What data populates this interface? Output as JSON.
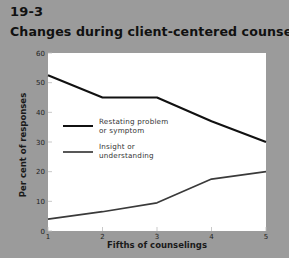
{
  "figure": {
    "number": "19-3",
    "title": "Changes during client-centered counseling"
  },
  "colors": {
    "page_background": "#9b9b9b",
    "plot_background": "#ffffff",
    "restating_line": "#111111",
    "insight_line": "#3a3a3a"
  },
  "chart_data": {
    "type": "line",
    "title": "Changes during client-centered counseling",
    "xlabel": "Fifths of counselings",
    "ylabel": "Per cent of responses",
    "x": [
      1,
      2,
      3,
      4,
      5
    ],
    "xticks": [
      "1",
      "2",
      "3",
      "4",
      "5"
    ],
    "yticks": [
      "0",
      "10",
      "20",
      "30",
      "40",
      "50",
      "60"
    ],
    "ylim": [
      0,
      60
    ],
    "xlim": [
      1,
      5
    ],
    "grid": false,
    "legend_position": "inside-middle-left",
    "series": [
      {
        "name": "Restating problem or symptom",
        "values": [
          52.5,
          45,
          45,
          37,
          30
        ]
      },
      {
        "name": "Insight or understanding",
        "values": [
          4,
          6.5,
          9.5,
          17.5,
          20
        ]
      }
    ]
  },
  "legend": [
    {
      "label": "Restating problem\nor symptom"
    },
    {
      "label": "Insight or\nunderstanding"
    }
  ]
}
